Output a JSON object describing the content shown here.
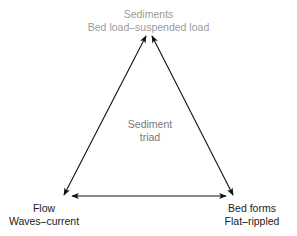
{
  "diagram": {
    "center": {
      "line1": "Sediment",
      "line2": "triad"
    },
    "nodes": [
      {
        "id": "sediments",
        "title": "Sediments",
        "subtitle": "Bed load–suspended load",
        "position": "top"
      },
      {
        "id": "flow",
        "title": "Flow",
        "subtitle": "Waves–current",
        "position": "bottom-left"
      },
      {
        "id": "bed_forms",
        "title": "Bed forms",
        "subtitle": "Flat–rippled",
        "position": "bottom-right"
      }
    ],
    "edges": [
      {
        "from": "flow",
        "to": "sediments",
        "bidirectional": true
      },
      {
        "from": "sediments",
        "to": "bed_forms",
        "bidirectional": true
      },
      {
        "from": "flow",
        "to": "bed_forms",
        "bidirectional": true
      }
    ],
    "colors": {
      "line": "#111111",
      "top_text": "#9a9a9a",
      "text": "#222222",
      "center_text": "#777777"
    }
  }
}
